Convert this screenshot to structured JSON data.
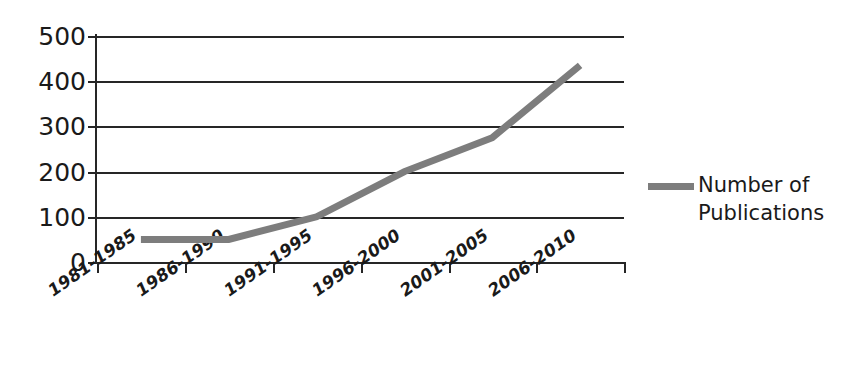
{
  "chart_data": {
    "type": "line",
    "title": "",
    "xlabel": "",
    "ylabel": "",
    "categories": [
      "1981-1985",
      "1986-1990",
      "1991-1995",
      "1996-2000",
      "2001-2005",
      "2006-2010"
    ],
    "series": [
      {
        "name": "Number of Publications",
        "values": [
          50,
          50,
          100,
          200,
          275,
          435
        ],
        "color": "#7d7d7d"
      }
    ],
    "ylim": [
      0,
      500
    ],
    "y_ticks": [
      0,
      100,
      200,
      300,
      400,
      500
    ],
    "y_tick_labels": [
      "0",
      "100",
      "200",
      "300",
      "400",
      "500"
    ],
    "grid": true,
    "grid_color": "#262626",
    "legend": {
      "position": "right",
      "entries": [
        {
          "label_line1": "Number of",
          "label_line2": "Publications",
          "marker": "line-swatch",
          "color": "#7d7d7d"
        }
      ]
    },
    "axis_color": "#262626",
    "background": "#ffffff"
  },
  "legend": {
    "text": "Number of Publications"
  }
}
